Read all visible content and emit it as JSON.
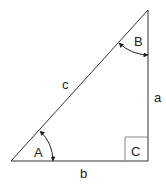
{
  "diagram": {
    "type": "right-triangle",
    "colors": {
      "stroke": "#333333",
      "right_angle_box": "#888888",
      "text": "#222222",
      "background": "#ffffff"
    },
    "vertices": {
      "A": [
        11,
        161
      ],
      "B": [
        148,
        10
      ],
      "C": [
        148,
        161
      ]
    },
    "angles": [
      {
        "id": "A",
        "label": "A",
        "arrowed_arc": true
      },
      {
        "id": "B",
        "label": "B",
        "arrowed_arc": true
      },
      {
        "id": "C",
        "label": "C",
        "right_angle": true
      }
    ],
    "sides": [
      {
        "id": "a",
        "label": "a",
        "between": [
          "B",
          "C"
        ]
      },
      {
        "id": "b",
        "label": "b",
        "between": [
          "A",
          "C"
        ]
      },
      {
        "id": "c",
        "label": "c",
        "between": [
          "A",
          "B"
        ]
      }
    ]
  }
}
